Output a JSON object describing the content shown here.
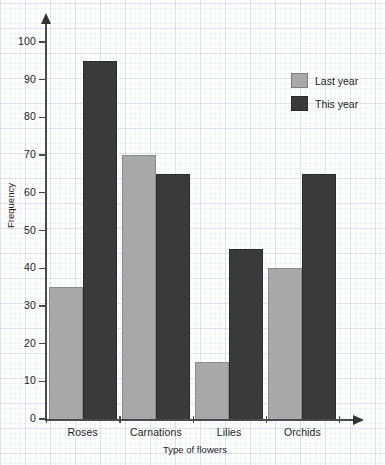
{
  "chart_data": {
    "type": "bar",
    "title": "",
    "xlabel": "Type of flowers",
    "ylabel": "Frequency",
    "categories": [
      "Roses",
      "Carnations",
      "Lilies",
      "Orchids"
    ],
    "series": [
      {
        "name": "Last year",
        "color": "#a8a8a8",
        "values": [
          35,
          70,
          15,
          40
        ]
      },
      {
        "name": "This year",
        "color": "#3a3a3a",
        "values": [
          95,
          65,
          45,
          65
        ]
      }
    ],
    "ylim": [
      0,
      100
    ],
    "ytick_labels": [
      "0",
      "10",
      "20",
      "30",
      "40",
      "50",
      "60",
      "70",
      "80",
      "90",
      "100"
    ],
    "ytick_values": [
      0,
      10,
      20,
      30,
      40,
      50,
      60,
      70,
      80,
      90,
      100
    ],
    "grid": true,
    "grid_style": "graph-paper",
    "legend_position": "top-right",
    "background_color": "#ffffff",
    "grid_color": "#96a5be",
    "axis_color": "#4a4a4a"
  },
  "legend": {
    "items": [
      {
        "label": "Last year"
      },
      {
        "label": "This year"
      }
    ]
  }
}
